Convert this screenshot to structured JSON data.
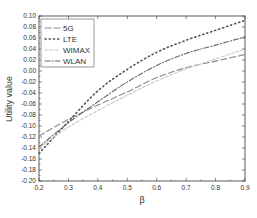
{
  "chart_data": {
    "type": "line",
    "title": "",
    "xlabel": "β",
    "ylabel": "Utility value",
    "xlim": [
      0.2,
      0.9
    ],
    "ylim": [
      -0.2,
      0.1
    ],
    "grid": false,
    "legend_position": "upper-left",
    "x": [
      0.2,
      0.3,
      0.4,
      0.5,
      0.6,
      0.7,
      0.8,
      0.9
    ],
    "x_ticks": [
      "0.2",
      "0.3",
      "0.4",
      "0.5",
      "0.6",
      "0.7",
      "0.8",
      "0.9"
    ],
    "y_ticks": [
      "0.10",
      "0.08",
      "0.06",
      "0.04",
      "0.02",
      "0.00",
      "-0.02",
      "-0.04",
      "-0.06",
      "-0.08",
      "-0.10",
      "-0.12",
      "-0.14",
      "-0.16",
      "-0.18",
      "-0.20"
    ],
    "series": [
      {
        "name": "5G",
        "style": "dash",
        "color": "#8a8a8a",
        "values": [
          -0.118,
          -0.088,
          -0.062,
          -0.038,
          -0.012,
          0.006,
          0.018,
          0.03
        ]
      },
      {
        "name": "LTE",
        "style": "dot",
        "color": "#555555",
        "values": [
          -0.15,
          -0.092,
          -0.036,
          0.003,
          0.034,
          0.056,
          0.074,
          0.092
        ]
      },
      {
        "name": "WIMAX",
        "style": "short-dash",
        "color": "#c8c8c8",
        "values": [
          -0.14,
          -0.102,
          -0.072,
          -0.044,
          -0.018,
          0.004,
          0.022,
          0.04
        ]
      },
      {
        "name": "WLAN",
        "style": "dash-dot",
        "color": "#666666",
        "values": [
          -0.138,
          -0.094,
          -0.056,
          -0.02,
          0.01,
          0.032,
          0.047,
          0.062
        ]
      }
    ]
  }
}
